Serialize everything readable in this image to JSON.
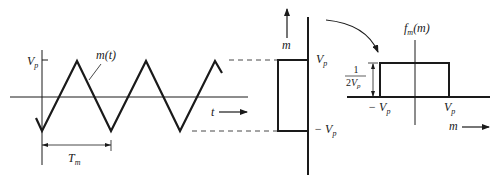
{
  "diagram": {
    "colors": {
      "stroke": "#1a1a1a",
      "background": "#ffffff"
    },
    "left_plot": {
      "signal_label": "m(t)",
      "amplitude_label": "V",
      "amplitude_sub": "p",
      "time_axis_label": "t",
      "period_label": "T",
      "period_sub": "m"
    },
    "middle_plot": {
      "axis_label": "m",
      "upper_level": "V",
      "upper_level_sub": "p",
      "lower_level_prefix": "− V",
      "lower_level_sub": "p"
    },
    "right_plot": {
      "density_label": "f",
      "density_sub": "m",
      "density_arg": "(m)",
      "height_numerator": "1",
      "height_denominator": "2V",
      "height_denominator_sub": "p",
      "left_edge": "− V",
      "left_edge_sub": "p",
      "right_edge": "V",
      "right_edge_sub": "p",
      "axis_label": "m"
    }
  }
}
